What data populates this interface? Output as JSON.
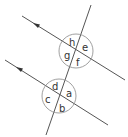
{
  "diagram": {
    "title": "",
    "type": "parallel lines cut by a transversal",
    "colors": {
      "line": "#555555",
      "circle": "#888888",
      "text": "#333333",
      "background": "#ffffff"
    },
    "upper_intersection": {
      "angles": {
        "top": "h",
        "right": "e",
        "left": "g",
        "bottom": "f"
      }
    },
    "lower_intersection": {
      "angles": {
        "top": "d",
        "right": "a",
        "left": "c",
        "bottom": "b"
      }
    },
    "arrows": [
      "parallel-arrow-upper",
      "parallel-arrow-lower"
    ]
  }
}
